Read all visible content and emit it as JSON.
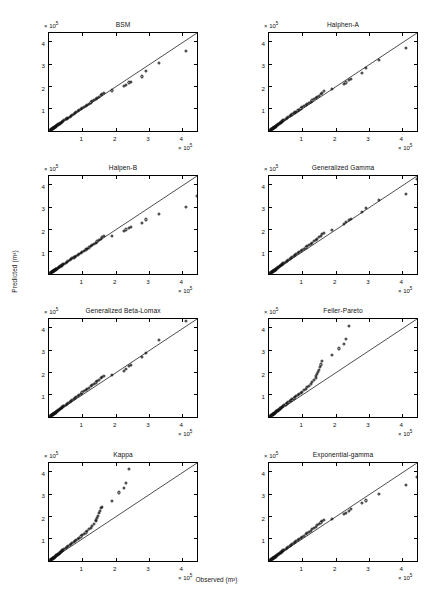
{
  "figure": {
    "xlabel": "Observed (m³)",
    "ylabel": "Predicted (m³)",
    "axis_multiplier_prefix": "× 10",
    "axis_multiplier_exponent": "5",
    "rows": 4,
    "cols": 2,
    "marker": "open-circle",
    "line": "1:1 reference line"
  },
  "chart_data": [
    {
      "type": "scatter",
      "title": "BSM",
      "xlabel": "Observed (m³)",
      "ylabel": "Predicted (m³)",
      "xlim": [
        0,
        4.5
      ],
      "ylim": [
        0,
        4.5
      ],
      "xticks": [
        1,
        2,
        3,
        4
      ],
      "yticks": [
        1,
        2,
        3,
        4
      ],
      "axis_scale": "1e5",
      "grid": false,
      "legend": "none",
      "reference_line": {
        "from": [
          0,
          0
        ],
        "to": [
          4.5,
          4.5
        ]
      },
      "x": [
        0.04,
        0.06,
        0.07,
        0.08,
        0.09,
        0.1,
        0.11,
        0.12,
        0.13,
        0.14,
        0.15,
        0.16,
        0.17,
        0.18,
        0.19,
        0.2,
        0.21,
        0.22,
        0.24,
        0.26,
        0.28,
        0.3,
        0.32,
        0.34,
        0.36,
        0.38,
        0.4,
        0.43,
        0.46,
        0.5,
        0.54,
        0.58,
        0.62,
        0.66,
        0.7,
        0.74,
        0.78,
        0.82,
        0.86,
        0.9,
        0.95,
        1.0,
        1.05,
        1.1,
        1.15,
        1.2,
        1.25,
        1.3,
        1.35,
        1.4,
        1.45,
        1.5,
        1.55,
        1.6,
        1.65,
        1.9,
        2.25,
        2.32,
        2.4,
        2.45,
        2.8,
        2.9,
        3.3,
        4.1
      ],
      "y": [
        0.05,
        0.06,
        0.07,
        0.08,
        0.09,
        0.1,
        0.11,
        0.12,
        0.13,
        0.14,
        0.15,
        0.16,
        0.17,
        0.18,
        0.19,
        0.2,
        0.21,
        0.23,
        0.25,
        0.27,
        0.29,
        0.31,
        0.33,
        0.35,
        0.37,
        0.39,
        0.42,
        0.45,
        0.48,
        0.52,
        0.56,
        0.6,
        0.64,
        0.68,
        0.72,
        0.76,
        0.8,
        0.84,
        0.89,
        0.93,
        0.98,
        1.03,
        1.08,
        1.12,
        1.18,
        1.23,
        1.28,
        1.33,
        1.38,
        1.43,
        1.48,
        1.53,
        1.6,
        1.66,
        1.72,
        1.82,
        2.02,
        2.05,
        2.18,
        2.2,
        2.45,
        2.68,
        3.05,
        3.6
      ]
    },
    {
      "type": "scatter",
      "title": "Halphen-A",
      "xlabel": "Observed (m³)",
      "ylabel": "Predicted (m³)",
      "xlim": [
        0,
        4.5
      ],
      "ylim": [
        0,
        4.5
      ],
      "xticks": [
        1,
        2,
        3,
        4
      ],
      "yticks": [
        1,
        2,
        3,
        4
      ],
      "axis_scale": "1e5",
      "grid": false,
      "legend": "none",
      "reference_line": {
        "from": [
          0,
          0
        ],
        "to": [
          4.5,
          4.5
        ]
      },
      "x": [
        0.04,
        0.06,
        0.07,
        0.08,
        0.09,
        0.1,
        0.11,
        0.12,
        0.13,
        0.14,
        0.15,
        0.16,
        0.17,
        0.18,
        0.19,
        0.2,
        0.21,
        0.22,
        0.24,
        0.26,
        0.28,
        0.3,
        0.32,
        0.34,
        0.36,
        0.38,
        0.4,
        0.43,
        0.46,
        0.5,
        0.54,
        0.58,
        0.62,
        0.66,
        0.7,
        0.74,
        0.78,
        0.82,
        0.86,
        0.9,
        0.95,
        1.0,
        1.05,
        1.1,
        1.15,
        1.2,
        1.25,
        1.3,
        1.35,
        1.4,
        1.45,
        1.5,
        1.55,
        1.6,
        1.65,
        1.9,
        2.25,
        2.32,
        2.4,
        2.45,
        2.8,
        2.9,
        3.3,
        4.1
      ],
      "y": [
        0.05,
        0.06,
        0.07,
        0.08,
        0.09,
        0.1,
        0.11,
        0.12,
        0.13,
        0.14,
        0.15,
        0.16,
        0.17,
        0.18,
        0.19,
        0.2,
        0.22,
        0.24,
        0.26,
        0.28,
        0.3,
        0.32,
        0.34,
        0.36,
        0.38,
        0.41,
        0.44,
        0.47,
        0.5,
        0.54,
        0.58,
        0.62,
        0.66,
        0.7,
        0.74,
        0.79,
        0.83,
        0.87,
        0.92,
        0.96,
        1.01,
        1.06,
        1.11,
        1.16,
        1.21,
        1.26,
        1.32,
        1.37,
        1.42,
        1.48,
        1.53,
        1.58,
        1.66,
        1.72,
        1.78,
        1.9,
        2.12,
        2.18,
        2.28,
        2.32,
        2.62,
        2.82,
        3.18,
        3.75
      ]
    },
    {
      "type": "scatter",
      "title": "Halpen-B",
      "xlabel": "Observed (m³)",
      "ylabel": "Predicted (m³)",
      "xlim": [
        0,
        4.5
      ],
      "ylim": [
        0,
        4.5
      ],
      "xticks": [
        1,
        2,
        3,
        4
      ],
      "yticks": [
        1,
        2,
        3,
        4
      ],
      "axis_scale": "1e5",
      "grid": false,
      "legend": "none",
      "reference_line": {
        "from": [
          0,
          0
        ],
        "to": [
          4.5,
          4.5
        ]
      },
      "x": [
        0.04,
        0.06,
        0.07,
        0.08,
        0.09,
        0.1,
        0.11,
        0.12,
        0.13,
        0.14,
        0.15,
        0.16,
        0.17,
        0.18,
        0.19,
        0.2,
        0.21,
        0.22,
        0.24,
        0.26,
        0.28,
        0.3,
        0.32,
        0.34,
        0.36,
        0.38,
        0.4,
        0.43,
        0.46,
        0.5,
        0.54,
        0.58,
        0.62,
        0.66,
        0.7,
        0.74,
        0.78,
        0.82,
        0.86,
        0.9,
        0.95,
        1.0,
        1.05,
        1.1,
        1.15,
        1.2,
        1.25,
        1.3,
        1.35,
        1.4,
        1.45,
        1.5,
        1.55,
        1.6,
        1.65,
        1.9,
        2.25,
        2.32,
        2.4,
        2.45,
        2.8,
        2.9,
        3.3,
        4.1,
        4.45
      ],
      "y": [
        0.05,
        0.06,
        0.07,
        0.08,
        0.09,
        0.1,
        0.11,
        0.12,
        0.13,
        0.14,
        0.15,
        0.16,
        0.17,
        0.18,
        0.19,
        0.2,
        0.21,
        0.22,
        0.24,
        0.26,
        0.28,
        0.3,
        0.32,
        0.34,
        0.36,
        0.38,
        0.4,
        0.43,
        0.46,
        0.5,
        0.54,
        0.58,
        0.62,
        0.66,
        0.7,
        0.74,
        0.78,
        0.82,
        0.86,
        0.9,
        0.95,
        1.0,
        1.05,
        1.1,
        1.14,
        1.19,
        1.24,
        1.29,
        1.34,
        1.4,
        1.46,
        1.52,
        1.58,
        1.65,
        1.7,
        1.72,
        1.95,
        2.0,
        2.05,
        2.1,
        2.3,
        2.45,
        2.68,
        3.0,
        3.52
      ]
    },
    {
      "type": "scatter",
      "title": "Generalized Gamma",
      "xlabel": "Observed (m³)",
      "ylabel": "Predicted (m³)",
      "xlim": [
        0,
        4.5
      ],
      "ylim": [
        0,
        4.5
      ],
      "xticks": [
        1,
        2,
        3,
        4
      ],
      "yticks": [
        1,
        2,
        3,
        4
      ],
      "axis_scale": "1e5",
      "grid": false,
      "legend": "none",
      "reference_line": {
        "from": [
          0,
          0
        ],
        "to": [
          4.5,
          4.5
        ]
      },
      "x": [
        0.04,
        0.06,
        0.07,
        0.08,
        0.09,
        0.1,
        0.11,
        0.12,
        0.13,
        0.14,
        0.15,
        0.16,
        0.17,
        0.18,
        0.19,
        0.2,
        0.21,
        0.22,
        0.24,
        0.26,
        0.28,
        0.3,
        0.32,
        0.34,
        0.36,
        0.38,
        0.4,
        0.43,
        0.46,
        0.5,
        0.54,
        0.58,
        0.62,
        0.66,
        0.7,
        0.74,
        0.78,
        0.82,
        0.86,
        0.9,
        0.95,
        1.0,
        1.05,
        1.1,
        1.15,
        1.2,
        1.25,
        1.3,
        1.35,
        1.4,
        1.45,
        1.5,
        1.55,
        1.6,
        1.65,
        1.9,
        2.25,
        2.32,
        2.4,
        2.45,
        2.8,
        2.9,
        3.3,
        4.1,
        4.45
      ],
      "y": [
        0.05,
        0.06,
        0.07,
        0.08,
        0.09,
        0.1,
        0.11,
        0.12,
        0.13,
        0.14,
        0.15,
        0.16,
        0.17,
        0.18,
        0.19,
        0.2,
        0.22,
        0.24,
        0.26,
        0.28,
        0.3,
        0.32,
        0.34,
        0.36,
        0.39,
        0.41,
        0.44,
        0.47,
        0.5,
        0.54,
        0.58,
        0.63,
        0.67,
        0.71,
        0.76,
        0.8,
        0.85,
        0.89,
        0.94,
        0.98,
        1.03,
        1.09,
        1.14,
        1.19,
        1.25,
        1.3,
        1.36,
        1.41,
        1.47,
        1.53,
        1.59,
        1.65,
        1.72,
        1.8,
        1.86,
        1.98,
        2.26,
        2.32,
        2.42,
        2.48,
        2.8,
        2.95,
        3.32,
        3.58,
        4.28
      ]
    },
    {
      "type": "scatter",
      "title": "Generalized Beta-Lomax",
      "xlabel": "Observed (m³)",
      "ylabel": "Predicted (m³)",
      "xlim": [
        0,
        4.5
      ],
      "ylim": [
        0,
        4.5
      ],
      "xticks": [
        1,
        2,
        3,
        4
      ],
      "yticks": [
        1,
        2,
        3,
        4
      ],
      "axis_scale": "1e5",
      "grid": false,
      "legend": "none",
      "reference_line": {
        "from": [
          0,
          0
        ],
        "to": [
          4.5,
          4.5
        ]
      },
      "x": [
        0.04,
        0.06,
        0.07,
        0.08,
        0.09,
        0.1,
        0.11,
        0.12,
        0.13,
        0.14,
        0.15,
        0.16,
        0.17,
        0.18,
        0.19,
        0.2,
        0.21,
        0.22,
        0.24,
        0.26,
        0.28,
        0.3,
        0.32,
        0.34,
        0.36,
        0.38,
        0.4,
        0.43,
        0.46,
        0.5,
        0.54,
        0.58,
        0.62,
        0.66,
        0.7,
        0.74,
        0.78,
        0.82,
        0.86,
        0.9,
        0.95,
        1.0,
        1.05,
        1.1,
        1.15,
        1.2,
        1.25,
        1.3,
        1.35,
        1.4,
        1.45,
        1.5,
        1.55,
        1.6,
        1.65,
        1.9,
        2.25,
        2.32,
        2.4,
        2.45,
        2.8,
        2.9,
        3.3,
        4.1
      ],
      "y": [
        0.05,
        0.06,
        0.07,
        0.08,
        0.09,
        0.1,
        0.11,
        0.12,
        0.13,
        0.14,
        0.15,
        0.16,
        0.17,
        0.18,
        0.19,
        0.2,
        0.22,
        0.24,
        0.26,
        0.28,
        0.3,
        0.32,
        0.35,
        0.37,
        0.39,
        0.42,
        0.45,
        0.48,
        0.51,
        0.55,
        0.59,
        0.64,
        0.68,
        0.72,
        0.77,
        0.81,
        0.86,
        0.9,
        0.95,
        1.0,
        1.05,
        1.1,
        1.15,
        1.21,
        1.26,
        1.32,
        1.38,
        1.43,
        1.49,
        1.55,
        1.61,
        1.68,
        1.74,
        1.8,
        1.86,
        1.9,
        2.08,
        2.15,
        2.28,
        2.32,
        2.68,
        2.88,
        3.48,
        4.32
      ]
    },
    {
      "type": "scatter",
      "title": "Feller-Pareto",
      "xlabel": "Observed (m³)",
      "ylabel": "Predicted (m³)",
      "xlim": [
        0,
        4.5
      ],
      "ylim": [
        0,
        4.5
      ],
      "xticks": [
        1,
        2,
        3,
        4
      ],
      "yticks": [
        1,
        2,
        3,
        4
      ],
      "axis_scale": "1e5",
      "grid": false,
      "legend": "none",
      "reference_line": {
        "from": [
          0,
          0
        ],
        "to": [
          4.5,
          4.5
        ]
      },
      "x": [
        0.04,
        0.06,
        0.07,
        0.08,
        0.09,
        0.1,
        0.11,
        0.12,
        0.13,
        0.14,
        0.15,
        0.16,
        0.17,
        0.18,
        0.19,
        0.2,
        0.21,
        0.22,
        0.24,
        0.26,
        0.28,
        0.3,
        0.32,
        0.34,
        0.36,
        0.38,
        0.4,
        0.43,
        0.46,
        0.5,
        0.54,
        0.58,
        0.62,
        0.66,
        0.7,
        0.74,
        0.78,
        0.82,
        0.86,
        0.9,
        0.95,
        1.0,
        1.05,
        1.1,
        1.15,
        1.2,
        1.25,
        1.3,
        1.35,
        1.4,
        1.42,
        1.45,
        1.48,
        1.5,
        1.53,
        1.56,
        1.6,
        1.9,
        2.1,
        2.25,
        2.32,
        2.4
      ],
      "y": [
        0.05,
        0.06,
        0.07,
        0.08,
        0.09,
        0.1,
        0.11,
        0.12,
        0.13,
        0.14,
        0.15,
        0.16,
        0.17,
        0.18,
        0.19,
        0.21,
        0.23,
        0.25,
        0.27,
        0.29,
        0.31,
        0.33,
        0.35,
        0.38,
        0.4,
        0.43,
        0.46,
        0.49,
        0.52,
        0.56,
        0.61,
        0.65,
        0.7,
        0.74,
        0.79,
        0.83,
        0.88,
        0.93,
        0.98,
        1.03,
        1.08,
        1.14,
        1.2,
        1.26,
        1.33,
        1.4,
        1.48,
        1.56,
        1.66,
        1.76,
        1.84,
        1.92,
        2.02,
        2.12,
        2.24,
        2.36,
        2.52,
        2.78,
        3.08,
        3.28,
        3.52,
        4.1
      ]
    },
    {
      "type": "scatter",
      "title": "Kappa",
      "xlabel": "Observed (m³)",
      "ylabel": "Predicted (m³)",
      "xlim": [
        0,
        4.5
      ],
      "ylim": [
        0,
        4.5
      ],
      "xticks": [
        1,
        2,
        3,
        4
      ],
      "yticks": [
        1,
        2,
        3,
        4
      ],
      "axis_scale": "1e5",
      "grid": false,
      "legend": "none",
      "reference_line": {
        "from": [
          0,
          0
        ],
        "to": [
          4.5,
          4.5
        ]
      },
      "x": [
        0.04,
        0.06,
        0.07,
        0.08,
        0.09,
        0.1,
        0.11,
        0.12,
        0.13,
        0.14,
        0.15,
        0.16,
        0.17,
        0.18,
        0.19,
        0.2,
        0.21,
        0.22,
        0.24,
        0.26,
        0.28,
        0.3,
        0.32,
        0.34,
        0.36,
        0.38,
        0.4,
        0.43,
        0.46,
        0.5,
        0.54,
        0.58,
        0.62,
        0.66,
        0.7,
        0.74,
        0.78,
        0.82,
        0.86,
        0.9,
        0.95,
        1.0,
        1.05,
        1.1,
        1.15,
        1.2,
        1.25,
        1.3,
        1.35,
        1.4,
        1.42,
        1.45,
        1.48,
        1.5,
        1.53,
        1.56,
        1.6,
        1.9,
        2.1,
        2.25,
        2.32,
        2.4
      ],
      "y": [
        0.05,
        0.06,
        0.07,
        0.08,
        0.09,
        0.1,
        0.11,
        0.12,
        0.13,
        0.14,
        0.15,
        0.16,
        0.17,
        0.18,
        0.19,
        0.21,
        0.23,
        0.25,
        0.27,
        0.29,
        0.31,
        0.33,
        0.36,
        0.38,
        0.41,
        0.44,
        0.47,
        0.5,
        0.53,
        0.57,
        0.62,
        0.66,
        0.71,
        0.75,
        0.8,
        0.85,
        0.9,
        0.95,
        1.0,
        1.05,
        1.1,
        1.16,
        1.22,
        1.28,
        1.35,
        1.42,
        1.5,
        1.58,
        1.68,
        1.78,
        1.86,
        1.94,
        2.04,
        2.14,
        2.26,
        2.38,
        2.42,
        2.68,
        3.08,
        3.28,
        3.52,
        4.12
      ]
    },
    {
      "type": "scatter",
      "title": "Exponential-gamma",
      "xlabel": "Observed (m³)",
      "ylabel": "Predicted (m³)",
      "xlim": [
        0,
        4.5
      ],
      "ylim": [
        0,
        4.5
      ],
      "xticks": [
        1,
        2,
        3,
        4
      ],
      "yticks": [
        1,
        2,
        3,
        4
      ],
      "axis_scale": "1e5",
      "grid": false,
      "legend": "none",
      "reference_line": {
        "from": [
          0,
          0
        ],
        "to": [
          4.5,
          4.5
        ]
      },
      "x": [
        0.04,
        0.06,
        0.07,
        0.08,
        0.09,
        0.1,
        0.11,
        0.12,
        0.13,
        0.14,
        0.15,
        0.16,
        0.17,
        0.18,
        0.19,
        0.2,
        0.21,
        0.22,
        0.24,
        0.26,
        0.28,
        0.3,
        0.32,
        0.34,
        0.36,
        0.38,
        0.4,
        0.43,
        0.46,
        0.5,
        0.54,
        0.58,
        0.62,
        0.66,
        0.7,
        0.74,
        0.78,
        0.82,
        0.86,
        0.9,
        0.95,
        1.0,
        1.05,
        1.1,
        1.15,
        1.2,
        1.25,
        1.3,
        1.35,
        1.4,
        1.45,
        1.5,
        1.55,
        1.6,
        1.65,
        1.9,
        2.25,
        2.32,
        2.4,
        2.45,
        2.8,
        2.9,
        3.3,
        4.1,
        4.45
      ],
      "y": [
        0.05,
        0.06,
        0.07,
        0.08,
        0.09,
        0.1,
        0.11,
        0.12,
        0.13,
        0.14,
        0.15,
        0.16,
        0.17,
        0.18,
        0.19,
        0.2,
        0.22,
        0.24,
        0.26,
        0.28,
        0.3,
        0.32,
        0.34,
        0.36,
        0.38,
        0.41,
        0.44,
        0.47,
        0.5,
        0.54,
        0.58,
        0.62,
        0.67,
        0.71,
        0.76,
        0.8,
        0.85,
        0.89,
        0.94,
        0.99,
        1.04,
        1.09,
        1.14,
        1.2,
        1.25,
        1.31,
        1.36,
        1.42,
        1.48,
        1.54,
        1.6,
        1.66,
        1.73,
        1.8,
        1.86,
        1.9,
        2.1,
        2.16,
        2.26,
        2.32,
        2.62,
        2.72,
        3.02,
        3.42,
        3.78
      ]
    }
  ]
}
